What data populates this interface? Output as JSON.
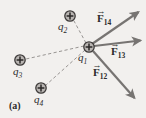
{
  "figure": {
    "panel_label": "(a)",
    "background_color": "#f2f0ee",
    "vector_color": "#777472",
    "dashed_color": "#8d8a88",
    "charge_color": "#4a4746",
    "text_color": "#2b2b2b"
  },
  "charges": [
    {
      "id": "q1",
      "name": "charge-q1",
      "symbol": "q",
      "subscript": "1",
      "sign": "+",
      "x": 89,
      "y": 47,
      "radius": 5.2,
      "label_x": 80,
      "label_y": 54
    },
    {
      "id": "q2",
      "name": "charge-q2",
      "symbol": "q",
      "subscript": "2",
      "sign": "+",
      "x": 70,
      "y": 16,
      "radius": 5.2,
      "label_x": 61,
      "label_y": 23
    },
    {
      "id": "q3",
      "name": "charge-q3",
      "symbol": "q",
      "subscript": "3",
      "sign": "+",
      "x": 20,
      "y": 60,
      "radius": 5.2,
      "label_x": 12,
      "label_y": 67
    },
    {
      "id": "q4",
      "name": "charge-q4",
      "symbol": "q",
      "subscript": "4",
      "sign": "+",
      "x": 41,
      "y": 88,
      "radius": 5.2,
      "label_x": 33,
      "label_y": 95
    }
  ],
  "force_vectors": [
    {
      "id": "F14",
      "name": "force-vector-F14",
      "symbol": "F",
      "subscript": "14",
      "from_x": 92,
      "from_y": 44,
      "to_x": 141,
      "to_y": 10,
      "label_x": 96,
      "label_y": 17
    },
    {
      "id": "F13",
      "name": "force-vector-F13",
      "symbol": "F",
      "subscript": "13",
      "from_x": 94,
      "from_y": 46,
      "to_x": 143,
      "to_y": 40,
      "label_x": 110,
      "label_y": 52
    },
    {
      "id": "F12",
      "name": "force-vector-F12",
      "symbol": "F",
      "subscript": "12",
      "from_x": 93,
      "from_y": 51,
      "to_x": 137,
      "to_y": 101,
      "label_x": 93,
      "label_y": 72
    }
  ],
  "dashed_lines": [
    {
      "id": "q1-q2",
      "name": "dashed-line-q1-q2",
      "x1": 86,
      "y1": 43,
      "x2": 74,
      "y2": 21
    },
    {
      "id": "q1-q3",
      "name": "dashed-line-q1-q3",
      "x1": 84,
      "y1": 46,
      "x2": 26,
      "y2": 59
    },
    {
      "id": "q1-q4",
      "name": "dashed-line-q1-q4",
      "x1": 85,
      "y1": 50,
      "x2": 46,
      "y2": 85
    }
  ]
}
